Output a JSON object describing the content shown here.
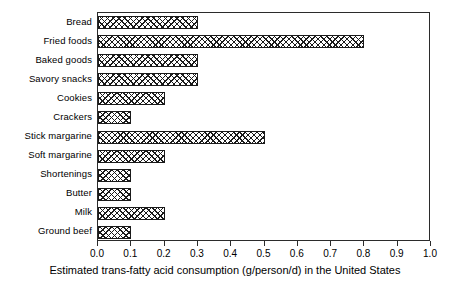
{
  "chart_data": {
    "type": "bar",
    "orientation": "horizontal",
    "title": "",
    "xlabel": "Estimated trans-fatty acid consumption (g/person/d) in the United States",
    "ylabel": "",
    "xlim": [
      0.0,
      1.0
    ],
    "xticks": [
      "0.0",
      "0.1",
      "0.2",
      "0.3",
      "0.4",
      "0.5",
      "0.6",
      "0.7",
      "0.8",
      "0.9",
      "1.0"
    ],
    "xtick_values": [
      0.0,
      0.1,
      0.2,
      0.3,
      0.4,
      0.5,
      0.6,
      0.7,
      0.8,
      0.9,
      1.0
    ],
    "grid": false,
    "legend": false,
    "bar_style": "cross-hatch",
    "categories": [
      "Bread",
      "Fried foods",
      "Baked goods",
      "Savory snacks",
      "Cookies",
      "Crackers",
      "Stick margarine",
      "Soft margarine",
      "Shortenings",
      "Butter",
      "Milk",
      "Ground beef"
    ],
    "values": [
      0.3,
      0.8,
      0.3,
      0.3,
      0.2,
      0.1,
      0.5,
      0.2,
      0.1,
      0.1,
      0.2,
      0.1
    ]
  },
  "colors": {
    "axis": "#2b2b2b",
    "bar_outline": "#1a1a1a",
    "bar_fill": "#ffffff",
    "hatch": "#1a1a1a",
    "background": "#ffffff",
    "text": "#000000"
  }
}
